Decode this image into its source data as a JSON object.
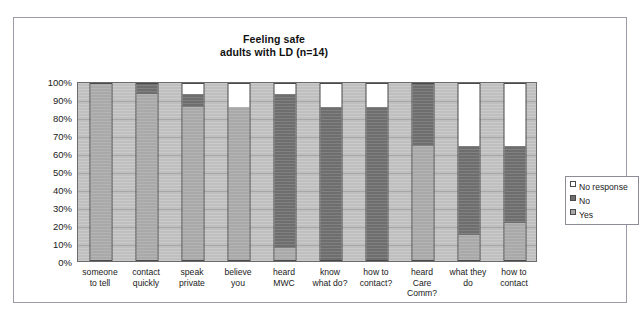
{
  "chart_data": {
    "type": "bar",
    "subtype": "stacked-percentage-column",
    "title": "Feeling safe",
    "subtitle": "adults with LD (n=14)",
    "xlabel": "",
    "ylabel": "",
    "ylim": [
      0,
      100
    ],
    "grid": true,
    "legend_position": "right",
    "legend": [
      "No response",
      "No",
      "Yes"
    ],
    "yticks": [
      "0%",
      "10%",
      "20%",
      "30%",
      "40%",
      "50%",
      "60%",
      "70%",
      "80%",
      "90%",
      "100%"
    ],
    "ytick_values": [
      0,
      10,
      20,
      30,
      40,
      50,
      60,
      70,
      80,
      90,
      100
    ],
    "categories": [
      "someone to tell",
      "contact quickly",
      "speak private",
      "believe you",
      "heard MWC",
      "know what do?",
      "how to contact?",
      "heard Care Comm?",
      "what they do",
      "how to contact"
    ],
    "category_lines": [
      [
        "someone",
        "to tell"
      ],
      [
        "contact",
        "quickly"
      ],
      [
        "speak",
        "private"
      ],
      [
        "believe",
        "you"
      ],
      [
        "heard",
        "MWC"
      ],
      [
        "know",
        "what do?"
      ],
      [
        "how to",
        "contact?"
      ],
      [
        "heard",
        "Care",
        "Comm?"
      ],
      [
        "what they",
        "do"
      ],
      [
        "how to",
        "contact"
      ]
    ],
    "series": [
      {
        "name": "Yes",
        "color": "#a9a9a9",
        "values": [
          100,
          93,
          86,
          86,
          7,
          0,
          0,
          64,
          14,
          21
        ]
      },
      {
        "name": "No",
        "color": "#6e6e6e",
        "values": [
          0,
          7,
          7,
          0,
          86,
          86,
          86,
          36,
          50,
          43
        ]
      },
      {
        "name": "No response",
        "color": "#ffffff",
        "values": [
          0,
          0,
          7,
          14,
          7,
          14,
          14,
          0,
          36,
          36
        ]
      }
    ]
  },
  "colors": {
    "plot_background": "#bfbfbf",
    "gridline": "#a8a8a8",
    "bar_outline": "#4a4a4a",
    "frame_border": "#9a9aa8",
    "text": "#1a1a1a"
  }
}
